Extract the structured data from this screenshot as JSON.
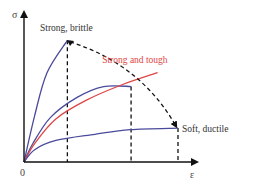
{
  "chart_data": {
    "type": "line",
    "title": "",
    "xlabel": "ε",
    "ylabel": "σ",
    "origin_label": "0",
    "xlim": [
      0,
      1
    ],
    "ylim": [
      0,
      1
    ],
    "grid": false,
    "series": [
      {
        "name": "Strong, brittle",
        "color": "#4a4a9c",
        "points": [
          [
            0,
            0
          ],
          [
            0.06,
            0.3
          ],
          [
            0.13,
            0.58
          ],
          [
            0.245,
            0.79
          ]
        ],
        "label": "Strong, brittle",
        "label_position": "above-end"
      },
      {
        "name": "Intermediate",
        "color": "#4a4a9c",
        "points": [
          [
            0,
            0
          ],
          [
            0.05,
            0.12
          ],
          [
            0.15,
            0.29
          ],
          [
            0.3,
            0.42
          ],
          [
            0.45,
            0.49
          ],
          [
            0.605,
            0.49
          ]
        ],
        "label": "",
        "label_position": ""
      },
      {
        "name": "Strong and tough",
        "color": "#e04545",
        "points": [
          [
            0,
            0
          ],
          [
            0.06,
            0.12
          ],
          [
            0.18,
            0.28
          ],
          [
            0.35,
            0.4
          ],
          [
            0.55,
            0.5
          ],
          [
            0.755,
            0.58
          ]
        ],
        "label": "Strong and tough",
        "label_position": "above-end"
      },
      {
        "name": "Soft, ductile",
        "color": "#4a4a9c",
        "points": [
          [
            0,
            0
          ],
          [
            0.06,
            0.08
          ],
          [
            0.18,
            0.14
          ],
          [
            0.4,
            0.18
          ],
          [
            0.6,
            0.21
          ],
          [
            0.87,
            0.22
          ]
        ],
        "label": "Soft, ductile",
        "label_position": "right-end"
      }
    ],
    "annotations": [
      {
        "type": "dashed-vertical",
        "x": 0.245,
        "from_series": "Strong, brittle"
      },
      {
        "type": "dashed-vertical",
        "x": 0.605,
        "from_series": "Intermediate"
      },
      {
        "type": "dashed-vertical",
        "x": 0.87,
        "from_series": "Soft, ductile"
      },
      {
        "type": "dashed-arrow",
        "from": [
          0.26,
          0.78
        ],
        "to": [
          0.86,
          0.23
        ],
        "meaning": "trend from brittle to ductile"
      }
    ]
  },
  "colors": {
    "axis": "#111111",
    "blue": "#4a4a9c",
    "red": "#e04545",
    "dashed": "#111111"
  }
}
